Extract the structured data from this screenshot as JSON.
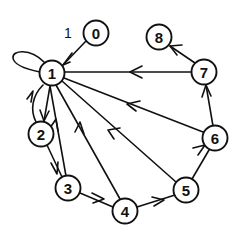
{
  "figure": {
    "type": "directed-graph-diagram",
    "width": 239,
    "height": 238,
    "background_color": "#ffffff",
    "stroke_color": "#111111"
  },
  "nodes": [
    {
      "id": "0",
      "label": "0",
      "cx": 96,
      "cy": 33,
      "r": 12.5
    },
    {
      "id": "1",
      "label": "1",
      "cx": 52,
      "cy": 73,
      "r": 12.5
    },
    {
      "id": "2",
      "label": "2",
      "cx": 41,
      "cy": 134,
      "r": 12.5
    },
    {
      "id": "3",
      "label": "3",
      "cx": 68,
      "cy": 188,
      "r": 12.5
    },
    {
      "id": "4",
      "label": "4",
      "cx": 125,
      "cy": 211,
      "r": 12.5
    },
    {
      "id": "5",
      "label": "5",
      "cx": 186,
      "cy": 190,
      "r": 12.5
    },
    {
      "id": "6",
      "label": "6",
      "cx": 215,
      "cy": 138,
      "r": 12.5
    },
    {
      "id": "7",
      "label": "7",
      "cx": 204,
      "cy": 72,
      "r": 12.5
    },
    {
      "id": "8",
      "label": "8",
      "cx": 159,
      "cy": 37,
      "r": 12.5
    }
  ],
  "edges": [
    {
      "id": "e-1-1",
      "from": "1",
      "to": "1",
      "kind": "self-loop",
      "label": "1",
      "label_x": 68,
      "label_y": 33
    },
    {
      "id": "e-0-1",
      "from": "0",
      "to": "1",
      "kind": "straight"
    },
    {
      "id": "e-7-1",
      "from": "7",
      "to": "1",
      "kind": "straight"
    },
    {
      "id": "e-6-1",
      "from": "6",
      "to": "1",
      "kind": "straight"
    },
    {
      "id": "e-5-1",
      "from": "5",
      "to": "1",
      "kind": "straight"
    },
    {
      "id": "e-4-1",
      "from": "4",
      "to": "1",
      "kind": "straight"
    },
    {
      "id": "e-3-1",
      "from": "3",
      "to": "1",
      "kind": "straight"
    },
    {
      "id": "e-2-1",
      "from": "2",
      "to": "1",
      "kind": "curved"
    },
    {
      "id": "e-1-2",
      "from": "1",
      "to": "2",
      "kind": "straight"
    },
    {
      "id": "e-2-3",
      "from": "2",
      "to": "3",
      "kind": "straight"
    },
    {
      "id": "e-3-4",
      "from": "3",
      "to": "4",
      "kind": "straight"
    },
    {
      "id": "e-4-5",
      "from": "4",
      "to": "5",
      "kind": "straight"
    },
    {
      "id": "e-5-6",
      "from": "5",
      "to": "6",
      "kind": "straight"
    },
    {
      "id": "e-6-7",
      "from": "6",
      "to": "7",
      "kind": "straight"
    },
    {
      "id": "e-7-8",
      "from": "7",
      "to": "8",
      "kind": "straight"
    }
  ],
  "labels": {
    "node_0": "0",
    "node_1": "1",
    "node_2": "2",
    "node_3": "3",
    "node_4": "4",
    "node_5": "5",
    "node_6": "6",
    "node_7": "7",
    "node_8": "8",
    "edge_self_loop_weight": "1"
  }
}
